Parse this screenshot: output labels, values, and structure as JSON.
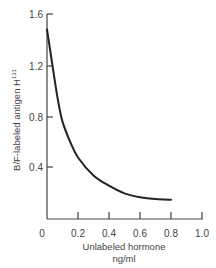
{
  "chart_data": {
    "type": "line",
    "title": "",
    "xlabel": "Unlabeled hormone",
    "xlabel_unit": "ng/ml",
    "ylabel": "B/F-labeled antigen H",
    "ylabel_superscript": "131",
    "xlim": [
      0,
      1.0
    ],
    "ylim": [
      0,
      1.6
    ],
    "x_ticks": [
      0,
      0.2,
      0.4,
      0.6,
      0.8,
      1.0
    ],
    "x_tick_labels": [
      "0",
      "0.2",
      "0.4",
      "0.6",
      "0.8",
      "1.0"
    ],
    "y_ticks": [
      0.4,
      0.8,
      1.2,
      1.6
    ],
    "y_tick_labels": [
      "0.4",
      "0.8",
      "1.2",
      "1.6"
    ],
    "grid": false,
    "legend": null,
    "series": [
      {
        "name": "B/F ratio",
        "x": [
          0,
          0.025,
          0.05,
          0.075,
          0.1,
          0.15,
          0.2,
          0.3,
          0.4,
          0.5,
          0.6,
          0.7,
          0.8
        ],
        "y": [
          1.48,
          1.28,
          1.08,
          0.9,
          0.76,
          0.6,
          0.48,
          0.34,
          0.26,
          0.2,
          0.17,
          0.155,
          0.15
        ]
      }
    ],
    "colors": {
      "line": "#222222",
      "axis": "#444444",
      "text": "#444444"
    }
  }
}
